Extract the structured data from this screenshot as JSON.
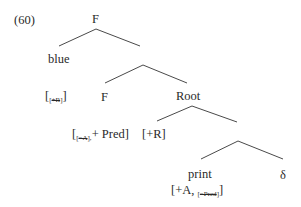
{
  "example_number": "(60)",
  "nodes": {
    "root_f": "F",
    "blue": "blue",
    "blue_feature": {
      "open": "[",
      "sub_open": "[",
      "sub_struck": "+R",
      "sub_close": "]",
      "close": "]"
    },
    "inner_f": "F",
    "inner_f_feature": {
      "open": "[",
      "sub_open": "[",
      "sub_struck": "−A",
      "sub_close": "],",
      "rest": "+ Pred]"
    },
    "root": "Root",
    "root_feature": "[+R]",
    "print": "print",
    "print_feature": {
      "open": "[+A,",
      "sub_open": "[",
      "sub_struck": "−Pred",
      "sub_close": "]",
      "close": "]"
    },
    "delta": "δ"
  }
}
